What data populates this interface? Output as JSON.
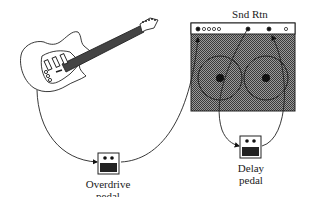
{
  "diagram": {
    "nodes": [
      {
        "id": "guitar",
        "label": "Electric guitar"
      },
      {
        "id": "overdrive",
        "label_line1": "Overdrive",
        "label_line2": "pedal"
      },
      {
        "id": "amp",
        "label": "Amplifier"
      },
      {
        "id": "delay",
        "label_line1": "Delay",
        "label_line2": "pedal"
      }
    ],
    "amp_label": "Snd Rtn",
    "edges": [
      {
        "from": "guitar",
        "to": "overdrive"
      },
      {
        "from": "overdrive",
        "to": "amp input"
      },
      {
        "from": "amp send",
        "to": "delay"
      },
      {
        "from": "delay",
        "to": "amp return"
      }
    ],
    "colors": {
      "line": "#1a1a1a",
      "grille": "#7a7a7a",
      "background": "#ffffff"
    }
  }
}
